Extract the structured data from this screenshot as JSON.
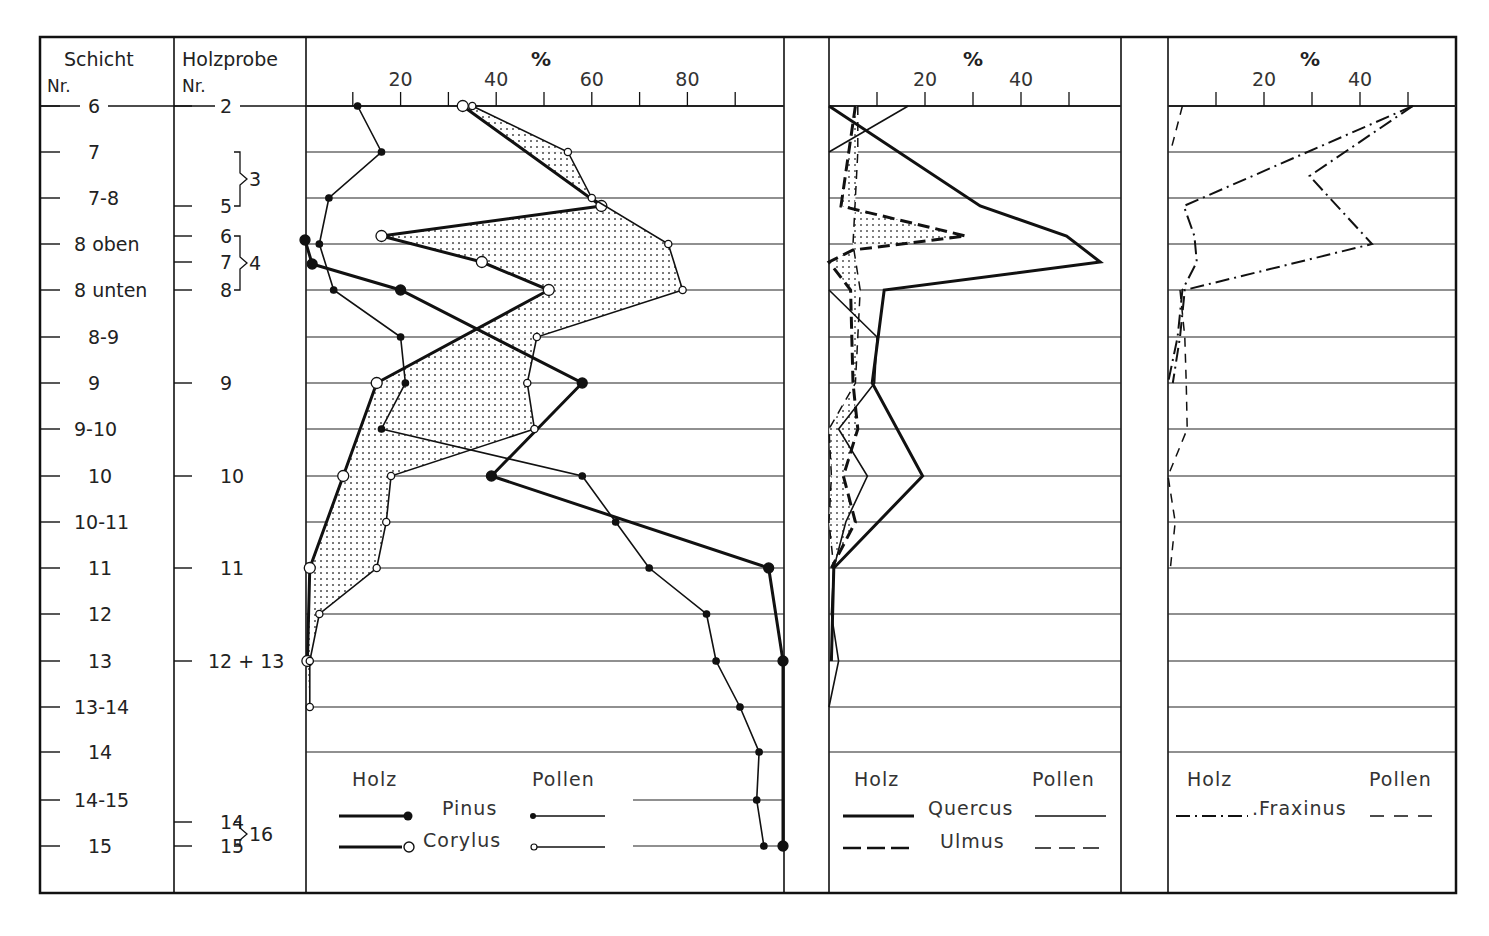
{
  "chart_data": {
    "type": "line",
    "title": "",
    "columns": {
      "schicht": {
        "header": "Schicht",
        "sub": "Nr."
      },
      "holzprobe": {
        "header": "Holzprobe",
        "sub": "Nr."
      }
    },
    "schicht_rows": [
      {
        "label": "6",
        "y": 106
      },
      {
        "label": "7",
        "y": 152
      },
      {
        "label": "7-8",
        "y": 198
      },
      {
        "label": "8 oben",
        "y": 244
      },
      {
        "label": "8 unten",
        "y": 290
      },
      {
        "label": "8-9",
        "y": 337
      },
      {
        "label": "9",
        "y": 383
      },
      {
        "label": "9-10",
        "y": 429
      },
      {
        "label": "10",
        "y": 476
      },
      {
        "label": "10-11",
        "y": 522
      },
      {
        "label": "11",
        "y": 568
      },
      {
        "label": "12",
        "y": 614
      },
      {
        "label": "13",
        "y": 661
      },
      {
        "label": "13-14",
        "y": 707
      },
      {
        "label": "14",
        "y": 752
      },
      {
        "label": "14-15",
        "y": 800
      },
      {
        "label": "15",
        "y": 846
      }
    ],
    "holzprobe_samples": [
      {
        "label": "2",
        "y": 106
      },
      {
        "label": "5",
        "y": 206
      },
      {
        "label": "6",
        "y": 236
      },
      {
        "label": "7",
        "y": 262
      },
      {
        "label": "8",
        "y": 290
      },
      {
        "label": "9",
        "y": 383
      },
      {
        "label": "10",
        "y": 476
      },
      {
        "label": "11",
        "y": 568
      },
      {
        "label": "12 + 13",
        "y": 661
      },
      {
        "label": "14",
        "y": 822
      },
      {
        "label": "15",
        "y": 846
      }
    ],
    "holzprobe_groups": [
      {
        "label": "3",
        "from_y": 152,
        "to_y": 206
      },
      {
        "label": "4",
        "from_y": 236,
        "to_y": 290
      },
      {
        "label": "16",
        "from_y": 822,
        "to_y": 846
      }
    ],
    "panels": [
      {
        "name": "Pinus / Corylus",
        "xlabel": "%",
        "x_origin_px": 305,
        "px_per_pct": 4.78,
        "ticks": [
          10,
          20,
          30,
          40,
          50,
          60,
          70,
          80,
          90
        ],
        "tick_labels": [
          "20",
          "40",
          "60",
          "80"
        ],
        "legend": {
          "left": "Holz",
          "right": "Pollen",
          "taxa": [
            "Pinus",
            "Corylus"
          ]
        },
        "series": [
          {
            "name": "Pinus Pollen",
            "style": "thin-dot",
            "points": [
              [
                106,
                11
              ],
              [
                152,
                16
              ],
              [
                198,
                5
              ],
              [
                244,
                3
              ],
              [
                290,
                6
              ],
              [
                337,
                20
              ],
              [
                383,
                21
              ],
              [
                429,
                16
              ],
              [
                476,
                58
              ],
              [
                522,
                65
              ],
              [
                568,
                72
              ],
              [
                614,
                84
              ],
              [
                661,
                86
              ],
              [
                707,
                91
              ],
              [
                752,
                95
              ],
              [
                800,
                94.5
              ],
              [
                846,
                96
              ]
            ]
          },
          {
            "name": "Pinus Holz",
            "style": "thick-dot",
            "points": [
              [
                240,
                0
              ],
              [
                264,
                1.5
              ],
              [
                290,
                20
              ],
              [
                383,
                58
              ],
              [
                476,
                39
              ],
              [
                568,
                97
              ],
              [
                661,
                100
              ],
              [
                846,
                100
              ]
            ]
          },
          {
            "name": "Corylus Holz",
            "style": "thick-circle",
            "points": [
              [
                106,
                33
              ],
              [
                206,
                62
              ],
              [
                236,
                16
              ],
              [
                262,
                37
              ],
              [
                290,
                51
              ],
              [
                383,
                15
              ],
              [
                476,
                8
              ],
              [
                568,
                1
              ],
              [
                661,
                0.5
              ]
            ]
          },
          {
            "name": "Corylus Pollen",
            "style": "thin-circle",
            "points": [
              [
                106,
                35
              ],
              [
                152,
                55
              ],
              [
                198,
                60
              ],
              [
                244,
                76
              ],
              [
                290,
                79
              ],
              [
                337,
                48.5
              ],
              [
                383,
                46.5
              ],
              [
                429,
                48
              ],
              [
                476,
                18
              ],
              [
                522,
                17
              ],
              [
                568,
                15
              ],
              [
                614,
                3
              ],
              [
                661,
                1
              ],
              [
                707,
                1
              ]
            ]
          }
        ]
      },
      {
        "name": "Quercus / Ulmus",
        "xlabel": "%",
        "x_origin_px": 829,
        "px_per_pct": 4.8,
        "ticks": [
          10,
          20,
          30,
          40,
          50
        ],
        "tick_labels": [
          "20",
          "40"
        ],
        "legend": {
          "left": "Holz",
          "right": "Pollen",
          "taxa": [
            "Quercus",
            "Ulmus"
          ]
        },
        "series": [
          {
            "name": "Quercus Holz",
            "style": "thick-solid",
            "points": [
              [
                106,
                0
              ],
              [
                206,
                31.5
              ],
              [
                236,
                49.5
              ],
              [
                262,
                56.5
              ],
              [
                290,
                11.5
              ],
              [
                383,
                9
              ],
              [
                476,
                19.5
              ],
              [
                568,
                1
              ],
              [
                661,
                0.5
              ]
            ]
          },
          {
            "name": "Quercus Pollen",
            "style": "thin-solid",
            "points": [
              [
                106,
                16.5
              ],
              [
                152,
                0
              ],
              [
                null,
                null
              ],
              [
                290,
                0
              ],
              [
                337,
                10
              ],
              [
                383,
                9.5
              ],
              [
                429,
                2
              ],
              [
                476,
                8
              ],
              [
                522,
                3.5
              ],
              [
                568,
                1
              ],
              [
                614,
                0.5
              ],
              [
                661,
                2
              ],
              [
                707,
                0
              ]
            ]
          },
          {
            "name": "Ulmus Holz",
            "style": "thick-dashed",
            "points": [
              [
                106,
                5.5
              ],
              [
                206,
                2.5
              ],
              [
                236,
                28.5
              ],
              [
                250,
                5
              ],
              [
                262,
                0
              ],
              [
                290,
                4.5
              ],
              [
                383,
                5
              ],
              [
                429,
                6
              ],
              [
                476,
                3
              ],
              [
                522,
                5.5
              ],
              [
                568,
                0.5
              ]
            ]
          },
          {
            "name": "Ulmus Pollen",
            "style": "thin-dashed",
            "points": [
              [
                106,
                6
              ],
              [
                152,
                6
              ],
              [
                198,
                5.5
              ],
              [
                244,
                5
              ],
              [
                290,
                6.5
              ],
              [
                337,
                6
              ],
              [
                383,
                5.5
              ],
              [
                429,
                0
              ],
              [
                476,
                0.5
              ],
              [
                522,
                0
              ],
              [
                568,
                1
              ]
            ]
          }
        ]
      },
      {
        "name": "Fraxinus",
        "xlabel": "%",
        "x_origin_px": 1168,
        "px_per_pct": 4.8,
        "ticks": [
          10,
          20,
          30,
          40,
          50
        ],
        "tick_labels": [
          "20",
          "40"
        ],
        "legend": {
          "left": "Holz",
          "right": "Pollen",
          "taxa": [
            "Fraxinus"
          ]
        },
        "series": [
          {
            "name": "Fraxinus Holz",
            "style": "dash-dot",
            "points": [
              [
                106,
                51
              ],
              [
                206,
                3.3
              ],
              [
                236,
                5.5
              ],
              [
                262,
                6
              ],
              [
                290,
                3
              ],
              [
                337,
                2
              ],
              [
                383,
                0
              ]
            ]
          },
          {
            "name": "Fraxinus Holz (2)",
            "style": "dash-dot",
            "points": [
              [
                106,
                51
              ],
              [
                176,
                29.5
              ],
              [
                244,
                42.5
              ],
              [
                290,
                3.5
              ],
              [
                337,
                2.5
              ],
              [
                383,
                1
              ]
            ]
          },
          {
            "name": "Fraxinus Pollen",
            "style": "dashed",
            "points": [
              [
                106,
                3
              ],
              [
                152,
                0.5
              ],
              [
                null,
                null
              ],
              [
                290,
                2.5
              ],
              [
                337,
                3.5
              ],
              [
                383,
                3.8
              ],
              [
                429,
                4
              ],
              [
                476,
                0
              ],
              [
                522,
                1.5
              ],
              [
                568,
                0.5
              ]
            ]
          }
        ]
      }
    ],
    "xlabel": "%",
    "ylabel": "Schicht Nr. / Holzprobe Nr.",
    "grid": true,
    "legend_position": "bottom of each panel"
  }
}
